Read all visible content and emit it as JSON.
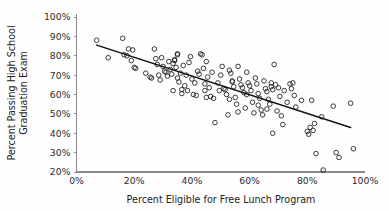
{
  "chart_data": {
    "type": "scatter",
    "title": "",
    "xlabel": "Percent Eligible for Free Lunch Program",
    "ylabel_line1": "Percent Passing High School",
    "ylabel_line2": "Graduation Exam",
    "xlim": [
      0,
      100
    ],
    "ylim": [
      20,
      100
    ],
    "xticks": [
      0,
      20,
      40,
      60,
      80,
      100
    ],
    "xtick_labels": [
      "0%",
      "20%",
      "40%",
      "60%",
      "80%",
      "100%"
    ],
    "yticks": [
      20,
      30,
      40,
      50,
      60,
      70,
      80,
      90,
      100
    ],
    "ytick_labels": [
      "20%",
      "30%",
      "40%",
      "50%",
      "60%",
      "70%",
      "80%",
      "90%",
      "100%"
    ],
    "grid": false,
    "legend": "none",
    "marker": "open-circle",
    "marker_color": "#1a1a1a",
    "trend_line": {
      "label": "linear fit",
      "color": "#111111",
      "x_start": 7,
      "y_start": 85.5,
      "x_end": 95,
      "y_end": 43.0
    },
    "points": [
      [
        7.0,
        88.0
      ],
      [
        11.0,
        79.0
      ],
      [
        16.0,
        89.0
      ],
      [
        16.5,
        80.5
      ],
      [
        17.5,
        80.0
      ],
      [
        18.0,
        83.5
      ],
      [
        19.5,
        83.0
      ],
      [
        19.0,
        77.5
      ],
      [
        20.0,
        74.0
      ],
      [
        20.5,
        73.5
      ],
      [
        25.5,
        69.0
      ],
      [
        26.0,
        68.5
      ],
      [
        27.0,
        83.5
      ],
      [
        27.5,
        78.5
      ],
      [
        28.0,
        75.5
      ],
      [
        28.5,
        70.0
      ],
      [
        29.0,
        67.5
      ],
      [
        29.5,
        79.0
      ],
      [
        30.0,
        74.5
      ],
      [
        30.5,
        72.0
      ],
      [
        31.0,
        71.5
      ],
      [
        31.5,
        69.5
      ],
      [
        32.0,
        77.0
      ],
      [
        32.5,
        73.0
      ],
      [
        33.0,
        70.5
      ],
      [
        33.5,
        76.0
      ],
      [
        33.5,
        62.0
      ],
      [
        34.0,
        77.5
      ],
      [
        34.0,
        78.0
      ],
      [
        34.5,
        74.0
      ],
      [
        35.0,
        81.0
      ],
      [
        35.0,
        80.5
      ],
      [
        35.5,
        66.5
      ],
      [
        36.0,
        71.0
      ],
      [
        36.5,
        62.5
      ],
      [
        36.5,
        60.5
      ],
      [
        37.0,
        75.0
      ],
      [
        37.5,
        64.5
      ],
      [
        38.0,
        70.0
      ],
      [
        38.5,
        62.0
      ],
      [
        39.0,
        76.5
      ],
      [
        39.5,
        79.5
      ],
      [
        40.0,
        68.0
      ],
      [
        40.5,
        60.0
      ],
      [
        41.0,
        66.0
      ],
      [
        41.5,
        59.5
      ],
      [
        42.0,
        72.0
      ],
      [
        42.5,
        70.5
      ],
      [
        43.0,
        81.0
      ],
      [
        43.5,
        80.5
      ],
      [
        44.0,
        73.5
      ],
      [
        44.5,
        65.5
      ],
      [
        44.5,
        62.0
      ],
      [
        45.0,
        77.0
      ],
      [
        45.5,
        69.0
      ],
      [
        46.0,
        63.5
      ],
      [
        46.5,
        59.0
      ],
      [
        47.0,
        71.5
      ],
      [
        47.5,
        58.0
      ],
      [
        48.0,
        45.5
      ],
      [
        49.0,
        66.0
      ],
      [
        50.0,
        70.0
      ],
      [
        50.5,
        74.5
      ],
      [
        51.0,
        63.0
      ],
      [
        51.5,
        62.5
      ],
      [
        52.0,
        60.0
      ],
      [
        52.5,
        49.5
      ],
      [
        53.0,
        72.5
      ],
      [
        53.5,
        71.0
      ],
      [
        54.0,
        67.0
      ],
      [
        54.0,
        66.5
      ],
      [
        54.5,
        64.0
      ],
      [
        55.0,
        58.5
      ],
      [
        55.5,
        55.0
      ],
      [
        56.0,
        74.5
      ],
      [
        56.5,
        68.0
      ],
      [
        57.0,
        65.0
      ],
      [
        57.5,
        63.5
      ],
      [
        58.0,
        61.0
      ],
      [
        58.5,
        53.0
      ],
      [
        59.0,
        71.5
      ],
      [
        59.5,
        66.0
      ],
      [
        60.0,
        64.5
      ],
      [
        60.5,
        62.0
      ],
      [
        61.0,
        56.0
      ],
      [
        61.5,
        50.5
      ],
      [
        62.0,
        68.5
      ],
      [
        62.5,
        65.5
      ],
      [
        63.0,
        60.5
      ],
      [
        63.5,
        58.0
      ],
      [
        64.0,
        52.0
      ],
      [
        64.5,
        49.5
      ],
      [
        65.0,
        67.0
      ],
      [
        65.5,
        63.0
      ],
      [
        66.0,
        61.5
      ],
      [
        66.5,
        57.5
      ],
      [
        67.0,
        55.0
      ],
      [
        67.5,
        66.0
      ],
      [
        67.5,
        64.0
      ],
      [
        68.0,
        62.5
      ],
      [
        68.5,
        75.5
      ],
      [
        69.0,
        65.0
      ],
      [
        69.5,
        51.5
      ],
      [
        70.0,
        63.5
      ],
      [
        70.5,
        59.0
      ],
      [
        71.0,
        49.0
      ],
      [
        71.5,
        44.5
      ],
      [
        72.0,
        62.0
      ],
      [
        73.0,
        56.0
      ],
      [
        74.0,
        65.5
      ],
      [
        74.5,
        63.0
      ],
      [
        75.0,
        66.0
      ],
      [
        75.5,
        59.5
      ],
      [
        76.0,
        53.5
      ],
      [
        78.0,
        57.0
      ],
      [
        80.0,
        41.0
      ],
      [
        80.5,
        39.5
      ],
      [
        81.0,
        43.0
      ],
      [
        81.5,
        57.0
      ],
      [
        82.0,
        41.5
      ],
      [
        82.5,
        45.0
      ],
      [
        83.0,
        29.5
      ],
      [
        85.0,
        48.5
      ],
      [
        85.5,
        21.0
      ],
      [
        89.0,
        54.0
      ],
      [
        90.0,
        30.0
      ],
      [
        91.0,
        27.5
      ],
      [
        95.0,
        55.5
      ],
      [
        96.0,
        32.0
      ],
      [
        24.0,
        71.0
      ],
      [
        45.0,
        58.5
      ],
      [
        56.0,
        51.0
      ],
      [
        63.0,
        54.5
      ],
      [
        68.0,
        40.0
      ],
      [
        35.0,
        68.5
      ],
      [
        49.5,
        62.0
      ],
      [
        53.0,
        57.5
      ],
      [
        59.0,
        60.0
      ],
      [
        66.0,
        52.5
      ]
    ]
  }
}
